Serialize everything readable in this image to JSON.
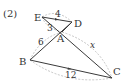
{
  "problem_label": "(2)",
  "points": {
    "E": {
      "label": "E",
      "x": 42,
      "y": 17
    },
    "D": {
      "label": "D",
      "x": 72,
      "y": 22
    },
    "A": {
      "label": "A",
      "x": 62,
      "y": 32
    },
    "B": {
      "label": "B",
      "x": 30,
      "y": 60
    },
    "C": {
      "label": "C",
      "x": 112,
      "y": 78
    }
  },
  "segments": {
    "ED": "4",
    "EA": "3",
    "AB": "6",
    "AC": "x",
    "BC": "12"
  },
  "notes": {
    "parallel": "ED ∥ BC (arrow marks)"
  }
}
